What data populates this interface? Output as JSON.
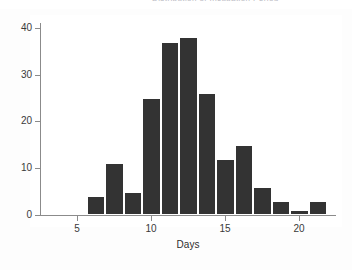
{
  "header": {
    "cutoff_text": "Distribution of Incubation Period"
  },
  "chart_data": {
    "type": "bar",
    "title": "",
    "subtitle": "",
    "xlabel": "Days",
    "ylabel": "",
    "xlim": [
      2.5,
      22.5
    ],
    "ylim": [
      0,
      41
    ],
    "grid": false,
    "legend": null,
    "bin_width": 1.25,
    "bar_color": "#333333",
    "background_color": "#ffffff",
    "axis_color": "#8b8b8b",
    "x_ticks": [
      5,
      10,
      15,
      20
    ],
    "y_ticks": [
      0,
      10,
      20,
      30,
      40
    ],
    "x_tick_labels": [
      "5",
      "10",
      "15",
      "20"
    ],
    "y_tick_labels": [
      "0",
      "10",
      "20",
      "30",
      "40"
    ],
    "bins": [
      {
        "left": 5.65,
        "right": 6.9,
        "value": 4
      },
      {
        "left": 6.9,
        "right": 8.15,
        "value": 11
      },
      {
        "left": 8.15,
        "right": 9.4,
        "value": 5
      },
      {
        "left": 9.4,
        "right": 10.65,
        "value": 25
      },
      {
        "left": 10.65,
        "right": 11.9,
        "value": 37
      },
      {
        "left": 11.9,
        "right": 13.15,
        "value": 38
      },
      {
        "left": 13.15,
        "right": 14.4,
        "value": 26
      },
      {
        "left": 14.4,
        "right": 15.65,
        "value": 12
      },
      {
        "left": 15.65,
        "right": 16.9,
        "value": 15
      },
      {
        "left": 16.9,
        "right": 18.15,
        "value": 6
      },
      {
        "left": 18.15,
        "right": 19.4,
        "value": 3
      },
      {
        "left": 19.4,
        "right": 20.65,
        "value": 1
      },
      {
        "left": 20.65,
        "right": 21.9,
        "value": 3
      },
      {
        "left": 24.4,
        "right": 25.65,
        "value": 1
      }
    ],
    "categories": [
      "5.65-6.9",
      "6.9-8.15",
      "8.15-9.4",
      "9.4-10.65",
      "10.65-11.9",
      "11.9-13.15",
      "13.15-14.4",
      "14.4-15.65",
      "15.65-16.9",
      "16.9-18.15",
      "18.15-19.4",
      "19.4-20.65",
      "20.65-21.9",
      "24.4-25.65"
    ],
    "values": [
      4,
      11,
      5,
      25,
      37,
      38,
      26,
      12,
      15,
      6,
      3,
      1,
      3,
      1
    ]
  }
}
